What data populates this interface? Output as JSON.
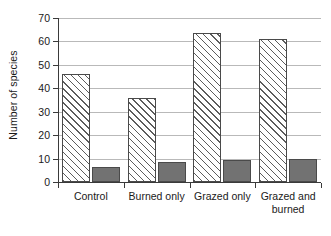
{
  "chart_data": {
    "type": "bar",
    "title": "",
    "xlabel": "",
    "ylabel": "Number of species",
    "ylim": [
      0,
      70
    ],
    "yticks": [
      0,
      10,
      20,
      30,
      40,
      50,
      60,
      70
    ],
    "ytick_labels": [
      "0",
      "10",
      "20",
      "30",
      "40",
      "50",
      "60",
      "70"
    ],
    "grid": true,
    "legend": "none",
    "categories": [
      "Control",
      "Burned only",
      "Grazed only",
      "Grazed and burned"
    ],
    "category_lines": [
      [
        "Control"
      ],
      [
        "Burned only"
      ],
      [
        "Grazed only"
      ],
      [
        "Grazed and",
        "burned"
      ]
    ],
    "series": [
      {
        "name": "hatched",
        "style": "diagonal-hatch",
        "color": "#ffffff",
        "hatch_color": "#5c5c5c",
        "values": [
          46,
          36,
          63.5,
          61
        ]
      },
      {
        "name": "solid-gray",
        "style": "solid",
        "color": "#727272",
        "values": [
          6.5,
          8.5,
          9.5,
          10
        ]
      }
    ]
  },
  "axis": {
    "spine_color": "#3a3a3a",
    "grid_color": "#b9b9b9"
  }
}
